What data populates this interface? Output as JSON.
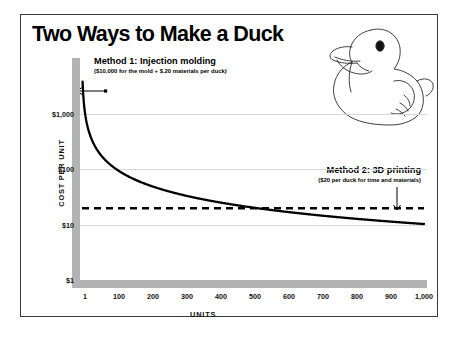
{
  "figure": {
    "title": "Two Ways to Make a Duck",
    "illustration_name": "rubber-duck-line-drawing"
  },
  "annotations": [
    {
      "id": "method1",
      "title": "Method 1: Injection molding",
      "subtitle": "($10,000 for the mold + $.20 materials per duck)",
      "pointer": "left-arrow"
    },
    {
      "id": "method2",
      "title": "Method 2: 3D printing",
      "subtitle": "($20 per duck for time and materials)",
      "pointer": "down-arrow"
    }
  ],
  "chart_data": {
    "type": "line",
    "title": "Two Ways to Make a Duck",
    "xlabel": "UNITS",
    "ylabel": "COST PER UNIT",
    "xlim": [
      1,
      1000
    ],
    "ylim": [
      1,
      10000
    ],
    "yscale": "log",
    "xscale": "linear",
    "grid": true,
    "legend": "none",
    "x_ticks": [
      1,
      100,
      200,
      300,
      400,
      500,
      600,
      700,
      800,
      900,
      1000
    ],
    "x_tick_labels": [
      "1",
      "100",
      "200",
      "300",
      "400",
      "500",
      "600",
      "700",
      "800",
      "900",
      "1,000"
    ],
    "y_ticks": [
      1,
      10,
      100,
      1000
    ],
    "y_tick_labels": [
      "$1",
      "$10",
      "$100",
      "$1,000"
    ],
    "series": [
      {
        "name": "Method 1: Injection molding",
        "style": "solid",
        "formula": "cost_per_unit = 10000/units + 0.20",
        "x": [
          1,
          2,
          3,
          5,
          8,
          10,
          15,
          20,
          30,
          40,
          50,
          75,
          100,
          150,
          200,
          250,
          300,
          350,
          400,
          450,
          500,
          530,
          600,
          700,
          800,
          900,
          1000
        ],
        "y": [
          10000.2,
          5000.2,
          3333.5,
          2000.2,
          1250.2,
          1000.2,
          666.9,
          500.2,
          333.5,
          250.2,
          200.2,
          133.5,
          100.2,
          66.9,
          50.2,
          40.2,
          33.5,
          28.8,
          25.2,
          22.4,
          20.2,
          19.1,
          16.9,
          14.5,
          12.7,
          11.3,
          10.2
        ]
      },
      {
        "name": "Method 2: 3D printing",
        "style": "dashed",
        "formula": "cost_per_unit = 20",
        "x": [
          1,
          1000
        ],
        "y": [
          20,
          20
        ]
      }
    ],
    "crossover": {
      "units": 530,
      "cost_per_unit": 20,
      "note": "curves intersect near 500-550 units"
    }
  },
  "colors": {
    "ink": "#000000",
    "axis_bar": "#b3b3b3",
    "gridline": "#d8d8d8",
    "frame": "#3b3b3b",
    "background": "#ffffff"
  }
}
